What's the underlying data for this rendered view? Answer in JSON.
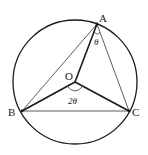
{
  "diagram": {
    "points": {
      "A": {
        "label": "A"
      },
      "B": {
        "label": "B"
      },
      "C": {
        "label": "C"
      },
      "O": {
        "label": "O"
      }
    },
    "angle_at_A": "θ",
    "angle_at_O": "2θ",
    "colors": {
      "stroke": "#1a1a1a",
      "thin_stroke": "#333333",
      "background": "#ffffff"
    }
  }
}
